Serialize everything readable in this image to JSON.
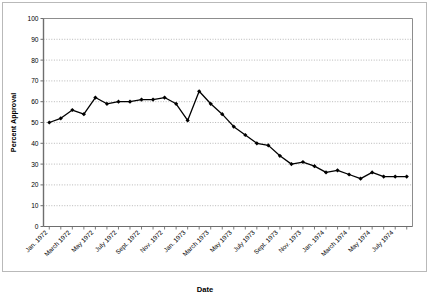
{
  "chart_data": {
    "type": "line",
    "title": "",
    "xlabel": "Date",
    "ylabel": "Percent Approval",
    "ylim": [
      0,
      100
    ],
    "ytick_step": 10,
    "yticks": [
      "0",
      "10",
      "20",
      "30",
      "40",
      "50",
      "60",
      "70",
      "80",
      "90",
      "100"
    ],
    "grid": true,
    "grid_axis": "y",
    "legend": "none",
    "series_color": "#000000",
    "marker": "diamond",
    "categories": [
      "Jan. 1972",
      "Feb. 1972",
      "March 1972",
      "April 1972",
      "May 1972",
      "June 1972",
      "July 1972",
      "Aug. 1972",
      "Sept. 1972",
      "Oct. 1972",
      "Nov. 1972",
      "Dec. 1972",
      "Jan. 1973",
      "Feb. 1973",
      "March 1973",
      "April 1973",
      "May 1973",
      "June 1973",
      "July 1973",
      "Aug. 1973",
      "Sept. 1973",
      "Oct. 1973",
      "Nov. 1973",
      "Dec. 1973",
      "Jan. 1974",
      "Feb. 1974",
      "March 1974",
      "April 1974",
      "May 1974",
      "June 1974",
      "July 1974",
      "Aug. 1974"
    ],
    "xtick_labels": [
      "Jan. 1972",
      "March 1972",
      "May 1972",
      "July 1972",
      "Sept. 1972",
      "Nov. 1972",
      "Jan. 1973",
      "March 1973",
      "May 1973",
      "July 1973",
      "Sept. 1973",
      "Nov. 1973",
      "Jan. 1974",
      "March 1974",
      "May 1974",
      "July 1974"
    ],
    "values": [
      50,
      52,
      56,
      54,
      62,
      59,
      60,
      60,
      61,
      61,
      62,
      59,
      51,
      65,
      59,
      54,
      48,
      44,
      40,
      39,
      34,
      30,
      31,
      29,
      26,
      27,
      25,
      23,
      26,
      24,
      24,
      24
    ]
  }
}
